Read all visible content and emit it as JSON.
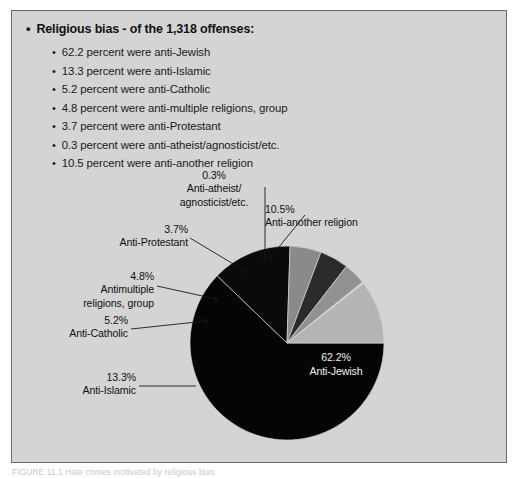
{
  "figure": {
    "heading": {
      "bullet": "•",
      "text": "Religious bias - of the 1,318 offenses:"
    },
    "bullet_items": [
      {
        "bullet": "•",
        "text": "62.2 percent were anti-Jewish"
      },
      {
        "bullet": "•",
        "text": "13.3 percent were anti-Islamic"
      },
      {
        "bullet": "•",
        "text": "5.2 percent were anti-Catholic"
      },
      {
        "bullet": "•",
        "text": "4.8 percent were anti-multiple religions, group"
      },
      {
        "bullet": "•",
        "text": "3.7 percent were anti-Protestant"
      },
      {
        "bullet": "•",
        "text": "0.3 percent were anti-atheist/agnosticist/etc."
      },
      {
        "bullet": "•",
        "text": "10.5 percent were anti-another religion"
      }
    ],
    "caption": "FIGURE 11.1  Hate crimes motivated by religious bias",
    "background_color": "#d4d4d4",
    "border_color": "#6b6b6b"
  },
  "chart_data": {
    "type": "pie",
    "title": "Religious bias - of the 1,318 offenses:",
    "total_offenses": 1318,
    "unit": "percent",
    "start_angle_deg": 0,
    "direction": "clockwise",
    "categories": [
      "Anti-Jewish",
      "Anti-Islamic",
      "Anti-Catholic",
      "Antimultiple religions, group",
      "Anti-Protestant",
      "Anti-atheist/agnosticist/etc.",
      "Anti-another religion"
    ],
    "values": [
      62.2,
      13.3,
      5.2,
      4.8,
      3.7,
      0.3,
      10.5
    ],
    "colors": [
      "#050505",
      "#0a0a0a",
      "#8a8a8a",
      "#2b2b2b",
      "#919191",
      "#cfcfcf",
      "#b4b4b4"
    ],
    "legend": "none",
    "grid": false,
    "slices": [
      {
        "label": "Anti-Jewish",
        "percent_text": "62.2%",
        "value": 62.2,
        "color": "#050505"
      },
      {
        "label": "Anti-Islamic",
        "percent_text": "13.3%",
        "value": 13.3,
        "color": "#0a0a0a"
      },
      {
        "label": "Anti-Catholic",
        "percent_text": "5.2%",
        "value": 5.2,
        "color": "#8a8a8a"
      },
      {
        "label": "Antimultiple religions, group",
        "percent_text": "4.8%",
        "value": 4.8,
        "color": "#2b2b2b"
      },
      {
        "label": "Anti-Protestant",
        "percent_text": "3.7%",
        "value": 3.7,
        "color": "#919191"
      },
      {
        "label": "Anti-atheist/agnosticist/etc.",
        "percent_text": "0.3%",
        "value": 0.3,
        "color": "#cfcfcf"
      },
      {
        "label": "Anti-another religion",
        "percent_text": "10.5%",
        "value": 10.5,
        "color": "#b4b4b4"
      }
    ]
  },
  "callouts": {
    "atheist": "0.3%\nAnti-atheist/\nagnosticist/etc.",
    "another": "10.5%\nAnti-another religion",
    "protestant": "3.7%\nAnti-Protestant",
    "multiple": "4.8%\nAntimultiple\nreligions, group",
    "catholic": "5.2%\nAnti-Catholic",
    "islamic": "13.3%\nAnti-Islamic",
    "jewish": "62.2%\nAnti-Jewish"
  }
}
